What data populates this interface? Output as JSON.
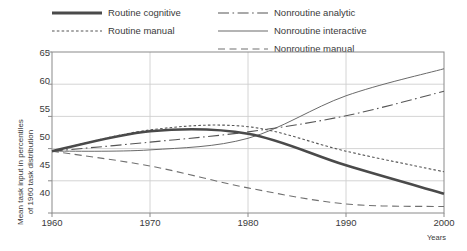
{
  "chart_data": {
    "type": "line",
    "title": "",
    "xlabel": "Years",
    "ylabel": "Mean task input in percentiles of 1960 task distribution",
    "ylabel_line1": "Mean task input in percentiles",
    "ylabel_line2": "of 1960 task distribution",
    "x": [
      1960,
      1970,
      1980,
      1990,
      2000
    ],
    "xlim": [
      1960,
      2000
    ],
    "ylim": [
      40,
      65
    ],
    "yticks": [
      40,
      45,
      50,
      55,
      60,
      65
    ],
    "xticks": [
      "1960",
      "1970",
      "1980",
      "1990",
      "2000"
    ],
    "grid": "horizontal-and-vertical",
    "legend_position": "top",
    "series": [
      {
        "name": "Routine cognitive",
        "style": "solid-thick",
        "color": "#4a4a4a",
        "values": [
          49.6,
          52.7,
          52.3,
          47.4,
          43.0
        ]
      },
      {
        "name": "Routine manual",
        "style": "dotted",
        "color": "#555555",
        "values": [
          49.6,
          52.9,
          53.4,
          49.6,
          46.4
        ]
      },
      {
        "name": "Nonroutine analytic",
        "style": "dash-dot",
        "color": "#555555",
        "values": [
          49.6,
          51.0,
          52.6,
          55.1,
          58.9
        ]
      },
      {
        "name": "Nonroutine interactive",
        "style": "solid-thin",
        "color": "#6a6a6a",
        "values": [
          49.6,
          49.8,
          51.6,
          58.2,
          62.4
        ]
      },
      {
        "name": "Nonroutine manual",
        "style": "dashed",
        "color": "#707070",
        "values": [
          49.6,
          47.3,
          43.9,
          41.4,
          41.0
        ]
      }
    ]
  },
  "colors": {
    "axis": "#8a8a8a",
    "grid": "#cfcfcf",
    "text": "#3a3a3a",
    "background": "#ffffff"
  }
}
